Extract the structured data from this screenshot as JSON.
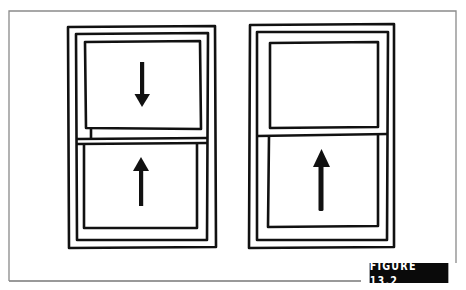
{
  "figure": {
    "label": "FIGURE 13.2",
    "colors": {
      "ink": "#111111",
      "frame": "#8a8a8a",
      "background": "#ffffff",
      "label_bg": "#0a0a0a",
      "label_text": "#ffffff"
    }
  },
  "windows": [
    {
      "name": "left-window",
      "description": "double-hung window, both sashes moving",
      "upper_sash_arrow": "down",
      "lower_sash_arrow": "up"
    },
    {
      "name": "right-window",
      "description": "single-hung window, only lower sash moving",
      "upper_sash_arrow": null,
      "lower_sash_arrow": "up"
    }
  ]
}
